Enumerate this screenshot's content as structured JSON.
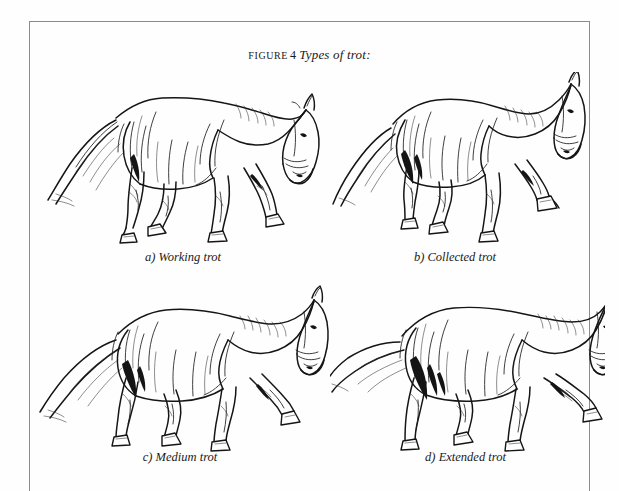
{
  "figure": {
    "label_word": "FIGURE",
    "number": "4",
    "phrase": "Types of trot:",
    "full_title": "FIGURE 4 Types of trot:"
  },
  "frame": {
    "present": true,
    "sides": "top-left-right",
    "color": "#8b8b8f"
  },
  "colors": {
    "ink": "#151515",
    "paper": "#fefefe",
    "rule": "#8b8b8f"
  },
  "panels": [
    {
      "key": "a",
      "marker": "a)",
      "caption": "a) Working trot",
      "name": "working-trot",
      "subject": "horse-trotting-side-view",
      "description": "Horse in working trot, moderate frame, nose slightly ahead of vertical, diagonal legs in support phase"
    },
    {
      "key": "b",
      "marker": "b)",
      "caption": "b) Collected trot",
      "name": "collected-trot",
      "subject": "horse-trotting-side-view",
      "description": "Horse in collected trot, shortened compact stride, elevated forehand, hindquarters engaged under body"
    },
    {
      "key": "c",
      "marker": "c)",
      "caption": "c) Medium trot",
      "name": "medium-trot",
      "subject": "horse-trotting-side-view",
      "description": "Horse in medium trot, lengthened stride, nose slightly in front of vertical, greater ground cover"
    },
    {
      "key": "d",
      "marker": "d)",
      "caption": "d) Extended trot",
      "name": "extended-trot",
      "subject": "horse-trotting-side-view",
      "description": "Horse in extended trot, maximum lengthening of stride and frame, foreleg reaching far forward"
    }
  ]
}
